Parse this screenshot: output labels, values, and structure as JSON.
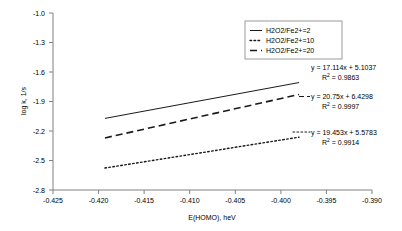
{
  "chart_data": {
    "type": "line",
    "title": "",
    "subtitle": "",
    "xlabel": "E(HOMO), heV",
    "ylabel": "log k, 1/s",
    "xlim": [
      -0.425,
      -0.39
    ],
    "ylim": [
      -2.8,
      -1.0
    ],
    "grid": false,
    "legend_position": "top-right",
    "xticks": [
      "-0.425",
      "-0.420",
      "-0.415",
      "-0.410",
      "-0.405",
      "-0.400",
      "-0.395",
      "-0.390"
    ],
    "xtick_values": [
      -0.425,
      -0.42,
      -0.415,
      -0.41,
      -0.405,
      -0.4,
      -0.395,
      -0.39
    ],
    "yticks": [
      "-1.0",
      "-1.3",
      "-1.6",
      "-1.9",
      "-2.2",
      "-2.5",
      "-2.8"
    ],
    "ytick_values": [
      -1.0,
      -1.3,
      -1.6,
      -1.9,
      -2.2,
      -2.5,
      -2.8
    ],
    "series": [
      {
        "name": "H2O2/Fe2+=2",
        "style": "solid",
        "slope": 17.114,
        "intercept": 5.1037,
        "r2": 0.9863,
        "equation": "y = 17.114x + 5.1037",
        "r2_label_prefix": "R",
        "r2_label_sup": "2",
        "r2_label_value": " = 0.9863",
        "x": [
          -0.4193,
          -0.398
        ],
        "y": [
          -2.0718,
          -1.7072
        ]
      },
      {
        "name": "H2O2/Fe2+=10",
        "style": "dashed",
        "slope": 20.75,
        "intercept": 6.4298,
        "r2": 0.9997,
        "equation": "y = 20.75x + 6.4298",
        "r2_label_prefix": "R",
        "r2_label_sup": "2",
        "r2_label_value": " = 0.9997",
        "x": [
          -0.4193,
          -0.398
        ],
        "y": [
          -2.2705,
          -1.8285
        ]
      },
      {
        "name": "H2O2/Fe2+=20",
        "style": "dotted",
        "slope": 19.453,
        "intercept": 5.5783,
        "r2": 0.9914,
        "equation": "y = 19.453x + 5.5783",
        "r2_label_prefix": "R",
        "r2_label_sup": "2",
        "r2_label_value": " = 0.9914",
        "x": [
          -0.4193,
          -0.398
        ],
        "y": [
          -2.5769,
          -2.2625
        ]
      }
    ],
    "annotations": [
      {
        "text": "y = 17.114x + 5.1037",
        "series": "H2O2/Fe2+=2"
      },
      {
        "text": "y = 20.75x + 6.4298",
        "series": "H2O2/Fe2+=10"
      },
      {
        "text": "y = 19.453x + 5.5783",
        "series": "H2O2/Fe2+=20"
      }
    ]
  },
  "axes": {
    "ylabel": "log k, 1/s",
    "xlabel": "E(HOMO), heV",
    "yticks": {
      "t0": "-1.0",
      "t1": "-1.3",
      "t2": "-1.6",
      "t3": "-1.9",
      "t4": "-2.2",
      "t5": "-2.5",
      "t6": "-2.8"
    },
    "xticks": {
      "t0": "-0.425",
      "t1": "-0.420",
      "t2": "-0.415",
      "t3": "-0.410",
      "t4": "-0.405",
      "t5": "-0.400",
      "t6": "-0.395",
      "t7": "-0.390"
    }
  },
  "legend": {
    "items": {
      "i0": "H2O2/Fe2+=2",
      "i1": "H2O2/Fe2+=10",
      "i2": "H2O2/Fe2+=20"
    }
  },
  "annotations": {
    "eq1": "y = 17.114x + 5.1037",
    "r2_1": " = 0.9863",
    "eq2": "y = 20.75x + 6.4298",
    "r2_2": " = 0.9997",
    "eq3": "y = 19.453x + 5.5783",
    "r2_3": " = 0.9914",
    "r_symbol": "R",
    "sup2": "2"
  },
  "colors": {
    "background": "#ffffff",
    "axis": "#808080",
    "series": "#1a1a1a",
    "legend_border": "#9a9a9a"
  }
}
